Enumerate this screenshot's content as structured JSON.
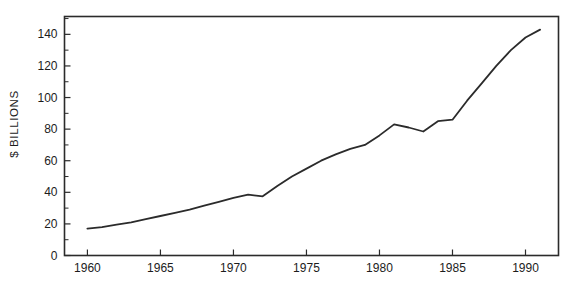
{
  "chart_data": {
    "type": "line",
    "title": "",
    "xlabel": "",
    "ylabel": "$ BILLIONS",
    "x": [
      1960,
      1961,
      1962,
      1963,
      1964,
      1965,
      1966,
      1967,
      1968,
      1969,
      1970,
      1971,
      1972,
      1973,
      1974,
      1975,
      1976,
      1977,
      1978,
      1979,
      1980,
      1981,
      1982,
      1983,
      1984,
      1985,
      1986,
      1987,
      1988,
      1989,
      1990,
      1991
    ],
    "series": [
      {
        "name": "dollars-billions",
        "values": [
          17,
          18,
          19.5,
          21,
          23,
          25,
          27,
          29,
          31.5,
          34,
          36.5,
          38.5,
          37.5,
          44,
          50,
          55,
          60,
          64,
          67.5,
          70,
          76,
          83,
          81,
          78.5,
          85,
          86,
          98,
          109,
          120,
          130,
          138,
          143
        ]
      }
    ],
    "xlim": [
      1958.43,
      1992.26
    ],
    "ylim": [
      0,
      151.3
    ],
    "xticks": {
      "major": [
        1960,
        1965,
        1970,
        1975,
        1980,
        1985,
        1990
      ]
    },
    "yticks": {
      "major": [
        0,
        20,
        40,
        60,
        80,
        100,
        120,
        140
      ],
      "minor": [
        10,
        30,
        50,
        70,
        90,
        110,
        130,
        150
      ]
    },
    "grid": false,
    "legend": "none",
    "colors": {
      "line": "#2b2b2b",
      "axis": "#2b2b2b",
      "text": "#1c1c1c",
      "background": "#ffffff"
    }
  }
}
